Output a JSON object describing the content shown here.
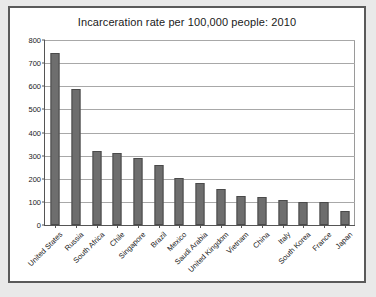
{
  "chart_data": {
    "type": "bar",
    "title": "Incarceration rate per 100,000 people: 2010",
    "xlabel": "",
    "ylabel": "",
    "ylim": [
      0,
      800
    ],
    "ytick_step": 100,
    "yticks": [
      0,
      100,
      200,
      300,
      400,
      500,
      600,
      700,
      800
    ],
    "grid": true,
    "legend": false,
    "categories": [
      "United States",
      "Russia",
      "South Africa",
      "Chile",
      "Singapore",
      "Brazil",
      "Mexico",
      "Saudi Arabia",
      "United Kingdom",
      "Vietnam",
      "China",
      "Italy",
      "South Korea",
      "France",
      "Japan"
    ],
    "values": [
      745,
      590,
      320,
      312,
      288,
      260,
      205,
      180,
      155,
      125,
      122,
      110,
      100,
      100,
      60
    ],
    "bar_color": "#6e6e6e",
    "bar_edge_color": "#4a4a4a",
    "plot_background": "#ffffff",
    "page_background": "#e9e9e9",
    "frame_color": "#5a5a5a",
    "gridline_color": "#a8a8a8"
  }
}
